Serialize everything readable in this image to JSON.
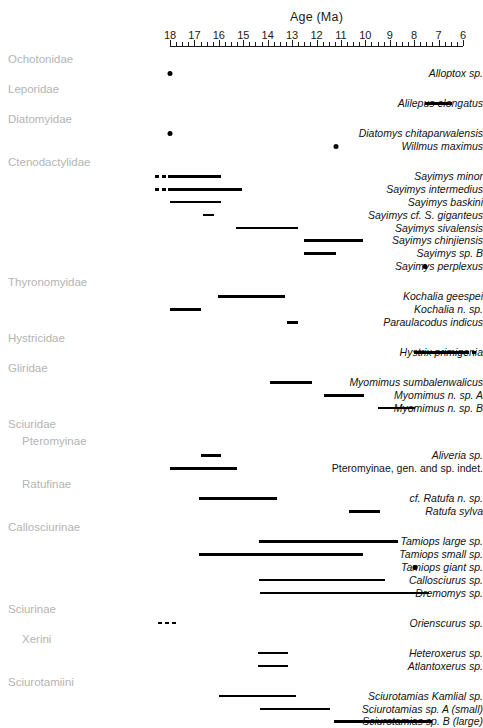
{
  "chart_data": {
    "type": "range-bar",
    "title": "Age (Ma)",
    "xlabel": "Age (Ma)",
    "ylabel": "",
    "xlim": [
      18,
      6
    ],
    "x_reversed": true,
    "major_ticks": [
      18,
      17,
      16,
      15,
      14,
      13,
      12,
      11,
      10,
      9,
      8,
      7,
      6
    ],
    "minor_tick_step": 0.25,
    "tick_labels": [
      "18",
      "17",
      "16",
      "15",
      "14",
      "13",
      "12",
      "11",
      "10",
      "9",
      "8",
      "7",
      "6"
    ],
    "grid": true,
    "legend": "none",
    "bar_color": "#000000",
    "grid_color": "#c9c9c9",
    "group_color": "#b4b4b4",
    "groups": [
      {
        "name": "Ochotonidae",
        "indent": 0,
        "taxa": [
          {
            "label": "Alloptox sp.",
            "italic": true,
            "type": "point",
            "at": 18.0
          }
        ]
      },
      {
        "name": "Leporidae",
        "indent": 0,
        "taxa": [
          {
            "label": "Alilepus elongatus",
            "italic": true,
            "type": "range",
            "start": 7.55,
            "end": 6.45
          }
        ]
      },
      {
        "name": "Diatomyidae",
        "indent": 0,
        "taxa": [
          {
            "label": "Diatomys chitaparwalensis",
            "italic": true,
            "type": "point",
            "at": 18.0
          },
          {
            "label": "Willmus maximus",
            "italic": true,
            "type": "point",
            "at": 11.2
          }
        ]
      },
      {
        "name": "Ctenodactylidae",
        "indent": 0,
        "taxa": [
          {
            "label": "Sayimys minor",
            "italic": true,
            "type": "range",
            "start": 18.1,
            "end": 15.9,
            "dashed_start": 18.6
          },
          {
            "label": "Sayimys intermedius",
            "italic": true,
            "type": "range",
            "start": 18.1,
            "end": 15.05,
            "dashed_start": 18.6
          },
          {
            "label": "Sayimys baskini",
            "italic": true,
            "type": "range",
            "start": 18.0,
            "end": 15.9
          },
          {
            "label": "Sayimys cf. S. giganteus",
            "italic": true,
            "type": "range",
            "start": 16.65,
            "end": 16.2
          },
          {
            "label": "Sayimys sivalensis",
            "italic": true,
            "type": "range",
            "start": 15.3,
            "end": 12.75
          },
          {
            "label": "Sayimys chinjiensis",
            "italic": true,
            "type": "range",
            "start": 12.5,
            "end": 10.1
          },
          {
            "label": "Sayimys sp. B",
            "italic": true,
            "type": "range",
            "start": 12.5,
            "end": 11.2
          },
          {
            "label": "Sayimys perplexus",
            "italic": true,
            "type": "point",
            "at": 7.55
          }
        ]
      },
      {
        "name": "Thyronomyidae",
        "indent": 0,
        "taxa": [
          {
            "label": "Kochalia geespei",
            "italic": true,
            "type": "range",
            "start": 16.05,
            "end": 13.3
          },
          {
            "label": "Kochalia n. sp.",
            "italic": true,
            "type": "range",
            "start": 18.0,
            "end": 16.75
          },
          {
            "label": "Paraulacodus indicus",
            "italic": true,
            "type": "range",
            "start": 13.2,
            "end": 12.75
          }
        ]
      },
      {
        "name": "Hystricidae",
        "indent": 0,
        "taxa": [
          {
            "label": "Hystrix primigenia",
            "italic": true,
            "type": "range",
            "start": 8.0,
            "end": 5.9,
            "dashed_end": 5.4
          }
        ]
      },
      {
        "name": "Gliridae",
        "indent": 0,
        "taxa": [
          {
            "label": "Myomimus sumbalenwalicus",
            "italic": true,
            "type": "range",
            "start": 13.9,
            "end": 12.2
          },
          {
            "label": "Myomimus n. sp. A",
            "italic": true,
            "type": "range",
            "start": 11.7,
            "end": 10.05
          },
          {
            "label": "Myomimus n. sp. B",
            "italic": true,
            "type": "range",
            "start": 9.5,
            "end": 7.95
          }
        ]
      },
      {
        "name": "Sciuridae",
        "indent": 0,
        "taxa": []
      },
      {
        "name": "Pteromyinae",
        "indent": 1,
        "taxa": [
          {
            "label": "Aliveria sp.",
            "italic": true,
            "type": "range",
            "start": 16.75,
            "end": 15.9
          },
          {
            "label": "Pteromyinae, gen. and sp. indet.",
            "italic": false,
            "type": "range",
            "start": 18.0,
            "end": 15.25
          }
        ]
      },
      {
        "name": "Ratufinae",
        "indent": 1,
        "taxa": [
          {
            "label": "cf. Ratufa n. sp.",
            "italic": true,
            "type": "range",
            "start": 16.8,
            "end": 13.6
          },
          {
            "label": "Ratufa sylva",
            "italic": true,
            "type": "range",
            "start": 10.65,
            "end": 9.4
          }
        ]
      },
      {
        "name": "Callosciurinae",
        "indent": 0,
        "taxa": [
          {
            "label": "Tamiops large sp.",
            "italic": true,
            "type": "range",
            "start": 14.35,
            "end": 8.65
          },
          {
            "label": "Tamiops small sp.",
            "italic": true,
            "type": "range",
            "start": 16.8,
            "end": 10.1
          },
          {
            "label": "Tamiops giant sp.",
            "italic": true,
            "type": "point",
            "at": 7.95
          },
          {
            "label": "Callosciurus sp.",
            "italic": true,
            "type": "range",
            "start": 14.35,
            "end": 9.2
          },
          {
            "label": "Dremomys sp.",
            "italic": true,
            "type": "range",
            "start": 14.3,
            "end": 7.4
          }
        ]
      },
      {
        "name": "Sciurinae",
        "indent": 0,
        "taxa": [
          {
            "label": "Orienscurus sp.",
            "italic": true,
            "type": "dashed-only",
            "start": 18.5,
            "end": 17.7
          }
        ]
      },
      {
        "name": "Xerini",
        "indent": 1,
        "taxa": [
          {
            "label": "Heteroxerus sp.",
            "italic": true,
            "type": "range",
            "start": 14.4,
            "end": 13.15
          },
          {
            "label": "Atlantoxerus sp.",
            "italic": true,
            "type": "range",
            "start": 14.4,
            "end": 13.15
          }
        ]
      },
      {
        "name": "Sciurotamiini",
        "indent": 0,
        "taxa": [
          {
            "label": "Sciurotamias Kamlial sp.",
            "italic": true,
            "type": "range",
            "start": 16.0,
            "end": 12.85
          },
          {
            "label": "Sciurotamias sp. A (small)",
            "italic": true,
            "type": "range",
            "start": 14.3,
            "end": 11.45
          },
          {
            "label": "Sciurotamias sp. B (large)",
            "italic": true,
            "type": "range",
            "start": 11.3,
            "end": 7.25
          }
        ]
      }
    ]
  }
}
